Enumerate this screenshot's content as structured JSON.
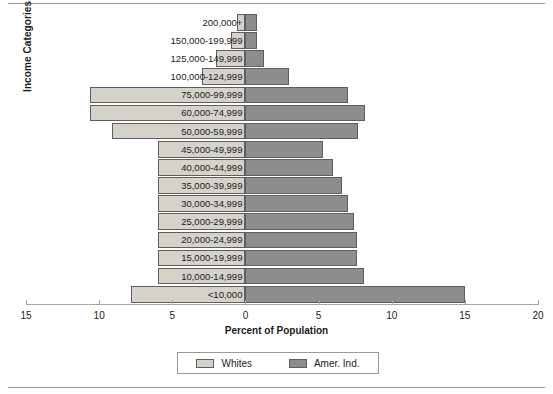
{
  "chart_data": {
    "type": "bar",
    "subtype": "population-pyramid",
    "title": "",
    "xlabel": "Percent of Population",
    "ylabel": "Income Categories",
    "grid": false,
    "legend_position": "bottom",
    "axis": {
      "left_max": 15,
      "right_max": 20,
      "zero_label": "0",
      "tick_labels": [
        "15",
        "10",
        "5",
        "0",
        "5",
        "10",
        "15",
        "20"
      ],
      "tick_values": [
        -15,
        -10,
        -5,
        0,
        5,
        10,
        15,
        20
      ]
    },
    "categories": [
      "200,000+",
      "150,000-199,999",
      "125,000-149,999",
      "100,000-124,999",
      "75,000-99,999",
      "60,000-74,999",
      "50,000-59,999",
      "45,000-49,999",
      "40,000-44,999",
      "35,000-39,999",
      "30,000-34,999",
      "25,000-29,999",
      "20,000-24,999",
      "15,000-19,999",
      "10,000-14,999",
      "<10,000"
    ],
    "series": [
      {
        "name": "Whites",
        "side": "left",
        "color": "#d5d2ca",
        "values": [
          0.6,
          1.0,
          2.0,
          3.0,
          10.6,
          10.6,
          9.1,
          6.0,
          6.0,
          6.0,
          6.0,
          6.0,
          6.0,
          6.0,
          6.0,
          7.8
        ]
      },
      {
        "name": "Amer. Ind.",
        "side": "right",
        "color": "#8d8d8d",
        "values": [
          0.8,
          0.8,
          1.3,
          3.0,
          7.0,
          8.2,
          7.7,
          5.3,
          6.0,
          6.6,
          7.0,
          7.4,
          7.6,
          7.6,
          8.1,
          15.0
        ]
      }
    ]
  },
  "legend": {
    "items": [
      {
        "label": "Whites",
        "color": "#d5d2ca"
      },
      {
        "label": "Amer. Ind.",
        "color": "#8d8d8d"
      }
    ]
  }
}
